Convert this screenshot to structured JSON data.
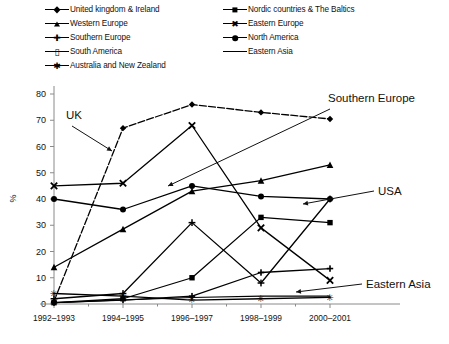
{
  "chart_data": {
    "type": "line",
    "title": "",
    "xlabel": "",
    "ylabel": "%",
    "ylim": [
      0,
      80
    ],
    "ytick_step": 10,
    "yticks": [
      0,
      10,
      20,
      30,
      40,
      50,
      60,
      70,
      80
    ],
    "grid": false,
    "legend_position": "top",
    "categories": [
      "1992–1993",
      "1994–1995",
      "1996–1997",
      "1998–1999",
      "2000–2001"
    ],
    "series": [
      {
        "name": "United kingdom & Ireland",
        "marker": "diamond",
        "values": [
          1,
          67,
          76,
          73,
          70.5
        ]
      },
      {
        "name": "Nordic countries & The Baltics",
        "marker": "square",
        "values": [
          0.5,
          2,
          10,
          33,
          31
        ]
      },
      {
        "name": "Western Europe",
        "marker": "triangle",
        "values": [
          14,
          28.5,
          43,
          47,
          53
        ]
      },
      {
        "name": "Eastern Europe",
        "marker": "ex",
        "values": [
          45,
          46,
          68,
          29,
          9
        ]
      },
      {
        "name": "Southern Europe",
        "marker": "cross",
        "values": [
          2,
          4,
          31,
          8,
          40
        ]
      },
      {
        "name": "North America",
        "marker": "circle",
        "values": [
          40,
          36,
          45,
          41,
          40
        ]
      },
      {
        "name": "South America",
        "marker": "bar",
        "values": [
          0.5,
          1.5,
          3,
          12,
          13.5
        ]
      },
      {
        "name": "Eastern Asia",
        "marker": "none",
        "values": [
          0.5,
          1.5,
          2.5,
          3,
          3
        ]
      },
      {
        "name": "Australia and New Zealand",
        "marker": "star",
        "values": [
          4,
          3,
          1.5,
          2,
          2.5
        ]
      }
    ],
    "annotations": [
      {
        "text": "UK",
        "target_series": "United kingdom & Ireland"
      },
      {
        "text": "Southern Europe",
        "target_series": "Southern Europe"
      },
      {
        "text": "USA",
        "target_series": "North America"
      },
      {
        "text": "Eastern Asia",
        "target_series": "Eastern Asia"
      }
    ]
  },
  "legend": {
    "left_column": [
      {
        "label": "United kingdom & Ireland",
        "marker": "diamond"
      },
      {
        "label": "Western Europe",
        "marker": "triangle"
      },
      {
        "label": "Southern Europe",
        "marker": "cross"
      },
      {
        "label": "South America",
        "marker": "bar"
      },
      {
        "label": "Australia and New Zealand",
        "marker": "star"
      }
    ],
    "right_column": [
      {
        "label": "Nordic countries & The Baltics",
        "marker": "square"
      },
      {
        "label": "Eastern Europe",
        "marker": "ex"
      },
      {
        "label": "North America",
        "marker": "circle"
      },
      {
        "label": "Eastern Asia",
        "marker": "none"
      }
    ]
  },
  "axes": {
    "y_title": "%",
    "y_labels": [
      "0",
      "10",
      "20",
      "30",
      "40",
      "50",
      "60",
      "70",
      "80"
    ],
    "x_labels": [
      "1992–1993",
      "1994–1995",
      "1996–1997",
      "1998–1999",
      "2000–2001"
    ]
  },
  "annotations": {
    "uk": "UK",
    "southern_europe": "Southern Europe",
    "usa": "USA",
    "eastern_asia": "Eastern Asia"
  },
  "colors": {
    "ink": "#000000",
    "axis": "#8a8a8a",
    "background": "#ffffff"
  }
}
